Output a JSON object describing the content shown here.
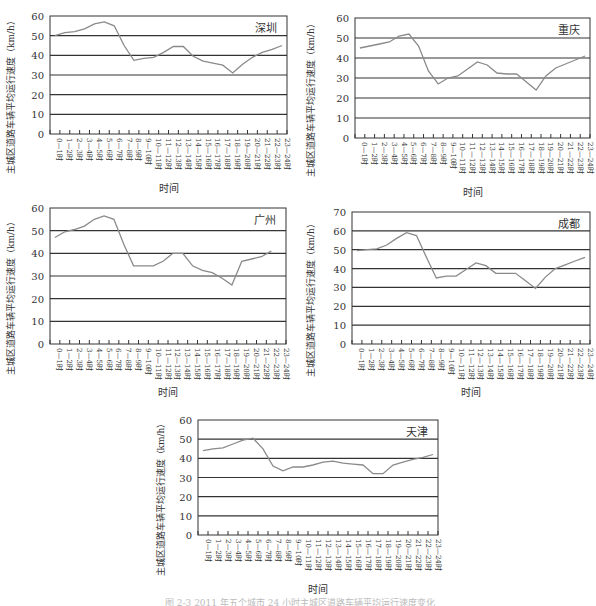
{
  "chart_data": [
    {
      "type": "line",
      "title": "深圳",
      "xlabel": "时间",
      "ylabel": "主城区道路车辆平均运行速度（km/h）",
      "ylim": [
        0,
        60
      ],
      "yticks": [
        0,
        10,
        20,
        30,
        40,
        50,
        60
      ],
      "grid": true,
      "categories": [
        "0—1时",
        "1—2时",
        "2—3时",
        "3—4时",
        "4—5时",
        "5—6时",
        "6—7时",
        "7—8时",
        "8—9时",
        "9—10时",
        "10—11时",
        "11—12时",
        "12—13时",
        "13—14时",
        "14—15时",
        "15—16时",
        "16—17时",
        "17—18时",
        "18—19时",
        "19—20时",
        "20—21时",
        "21—22时",
        "22—23时",
        "23—24时"
      ],
      "values": [
        50,
        51.5,
        52,
        53.5,
        56,
        57,
        55,
        45,
        37.5,
        38.5,
        39,
        41.5,
        44.5,
        44.5,
        39.5,
        37,
        36,
        35,
        31,
        35.5,
        39,
        41.5,
        43,
        45
      ]
    },
    {
      "type": "line",
      "title": "重庆",
      "xlabel": "时间",
      "ylabel": "主城区道路车辆平均运行速度（km/h）",
      "ylim": [
        0,
        60
      ],
      "yticks": [
        0,
        10,
        20,
        30,
        40,
        50,
        60
      ],
      "grid": true,
      "categories": [
        "0—1时",
        "1—2时",
        "2—3时",
        "3—4时",
        "4—5时",
        "5—6时",
        "6—7时",
        "7—8时",
        "8—9时",
        "9—10时",
        "10—11时",
        "11—12时",
        "12—13时",
        "13—14时",
        "14—15时",
        "15—16时",
        "16—17时",
        "17—18时",
        "18—19时",
        "19—20时",
        "20—21时",
        "21—22时",
        "22—23时",
        "23—24时"
      ],
      "values": [
        45,
        46,
        47,
        48,
        51,
        52,
        46,
        33.5,
        27,
        30,
        31,
        34.5,
        38,
        36.5,
        32.5,
        32,
        32,
        28,
        24,
        31,
        35,
        37,
        39,
        41
      ]
    },
    {
      "type": "line",
      "title": "广州",
      "xlabel": "时间",
      "ylabel": "主城区道路车辆平均运行速度（km/h）",
      "ylim": [
        0,
        60
      ],
      "yticks": [
        0,
        10,
        20,
        30,
        40,
        50,
        60
      ],
      "grid": true,
      "categories": [
        "0—1时",
        "1—2时",
        "2—3时",
        "3—4时",
        "4—5时",
        "5—6时",
        "6—7时",
        "7—8时",
        "8—9时",
        "9—10时",
        "10—11时",
        "11—12时",
        "12—13时",
        "13—14时",
        "14—15时",
        "15—16时",
        "16—17时",
        "17—18时",
        "18—19时",
        "19—20时",
        "20—21时",
        "21—22时",
        "22—23时",
        "23—24时"
      ],
      "values": [
        47,
        49.5,
        50.5,
        52,
        55,
        56.5,
        55,
        44,
        34.5,
        34.5,
        34.5,
        36.5,
        40,
        40,
        34.5,
        32.5,
        31.5,
        29,
        26,
        36.5,
        37.5,
        38.5,
        41
      ]
    },
    {
      "type": "line",
      "title": "成都",
      "xlabel": "时间",
      "ylabel": "主城区道路车辆平均运行速度（km/h）",
      "ylim": [
        0,
        70
      ],
      "yticks": [
        0,
        10,
        20,
        30,
        40,
        50,
        60,
        70
      ],
      "grid": true,
      "categories": [
        "0—1时",
        "1—2时",
        "2—3时",
        "3—4时",
        "4—5时",
        "5—6时",
        "6—7时",
        "7—8时",
        "8—9时",
        "9—10时",
        "10—11时",
        "11—12时",
        "12—13时",
        "13—14时",
        "14—15时",
        "15—16时",
        "16—17时",
        "17—18时",
        "18—19时",
        "19—20时",
        "20—21时",
        "21—22时",
        "22—23时",
        "23—24时"
      ],
      "values": [
        49.5,
        50,
        50.5,
        52.5,
        56,
        59,
        57.5,
        46,
        35,
        36,
        36,
        39.5,
        43,
        41.5,
        37.5,
        37.5,
        37.5,
        33.5,
        29.5,
        35.5,
        40,
        42,
        44,
        46
      ]
    },
    {
      "type": "line",
      "title": "天津",
      "xlabel": "时间",
      "ylabel": "主城区道路车辆平均运行速度（km/h）",
      "ylim": [
        0,
        60
      ],
      "yticks": [
        0,
        10,
        20,
        30,
        40,
        50,
        60
      ],
      "grid": true,
      "categories": [
        "0—1时",
        "1—2时",
        "2—3时",
        "3—4时",
        "4—5时",
        "5—6时",
        "6—7时",
        "7—8时",
        "8—9时",
        "9—10时",
        "10—11时",
        "11—12时",
        "12—13时",
        "13—14时",
        "14—15时",
        "15—16时",
        "16—17时",
        "17—18时",
        "18—19时",
        "19—20时",
        "20—21时",
        "21—22时",
        "22—23时",
        "23—24时"
      ],
      "values": [
        44,
        45,
        45.5,
        47.5,
        49.5,
        50.5,
        45,
        36,
        33.5,
        35.5,
        35.5,
        36.5,
        38,
        38.5,
        37.5,
        37,
        36.5,
        32,
        32,
        36.5,
        38,
        39.5,
        40.5,
        42
      ]
    }
  ],
  "layout": [
    {
      "panel_x": 0,
      "panel_y": 0,
      "plot": {
        "x": 50,
        "y": 16,
        "w": 237,
        "h": 118
      }
    },
    {
      "panel_x": 300,
      "panel_y": 0,
      "plot": {
        "x": 55,
        "y": 18,
        "w": 235,
        "h": 120
      }
    },
    {
      "panel_x": 0,
      "panel_y": 200,
      "plot": {
        "x": 50,
        "y": 8,
        "w": 236,
        "h": 136
      }
    },
    {
      "panel_x": 300,
      "panel_y": 200,
      "plot": {
        "x": 52,
        "y": 12,
        "w": 238,
        "h": 132
      }
    },
    {
      "panel_x": 150,
      "panel_y": 400,
      "plot": {
        "x": 48,
        "y": 20,
        "w": 240,
        "h": 115
      }
    }
  ],
  "colors": {
    "line": "#8a8a8a",
    "grid": "#333333",
    "axis": "#333333",
    "text": "#333333"
  },
  "caption": "图 2-3  2011 年五个城市 24 小时主城区道路车辆平均运行速度变化"
}
